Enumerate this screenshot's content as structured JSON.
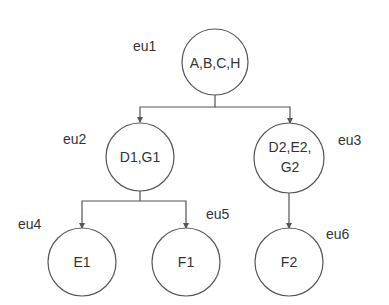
{
  "diagram": {
    "type": "tree",
    "nodes": [
      {
        "id": "eu1",
        "label": "eu1",
        "lines": [
          "A,B,C,H"
        ]
      },
      {
        "id": "eu2",
        "label": "eu2",
        "lines": [
          "D1,G1"
        ]
      },
      {
        "id": "eu3",
        "label": "eu3",
        "lines": [
          "D2,E2,",
          "G2"
        ]
      },
      {
        "id": "eu4",
        "label": "eu4",
        "lines": [
          "E1"
        ]
      },
      {
        "id": "eu5",
        "label": "eu5",
        "lines": [
          "F1"
        ]
      },
      {
        "id": "eu6",
        "label": "eu6",
        "lines": [
          "F2"
        ]
      }
    ],
    "edges": [
      {
        "from": "eu1",
        "to": "eu2"
      },
      {
        "from": "eu1",
        "to": "eu3"
      },
      {
        "from": "eu2",
        "to": "eu4"
      },
      {
        "from": "eu2",
        "to": "eu5"
      },
      {
        "from": "eu3",
        "to": "eu6"
      }
    ],
    "colors": {
      "stroke": "#555555",
      "text": "#333333",
      "background": "#ffffff"
    }
  }
}
